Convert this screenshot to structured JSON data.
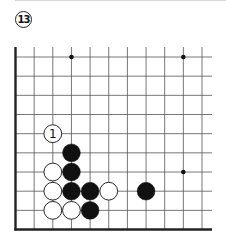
{
  "problem": {
    "number": "13"
  },
  "board": {
    "visible_columns": 11,
    "visible_rows": 10,
    "edges": [
      "left",
      "bottom"
    ],
    "colors": {
      "line": "#555555",
      "edge": "#222222",
      "black_stone": "#111111",
      "white_stone": "#ffffff"
    },
    "star_points": [
      {
        "col": 3,
        "row": 0
      },
      {
        "col": 9,
        "row": 0
      },
      {
        "col": 9,
        "row": 6
      }
    ],
    "stones": [
      {
        "color": "white",
        "col": 2,
        "row": 4,
        "label": "1"
      },
      {
        "color": "black",
        "col": 3,
        "row": 5
      },
      {
        "color": "white",
        "col": 2,
        "row": 6
      },
      {
        "color": "black",
        "col": 3,
        "row": 6
      },
      {
        "color": "white",
        "col": 2,
        "row": 7
      },
      {
        "color": "black",
        "col": 3,
        "row": 7
      },
      {
        "color": "black",
        "col": 4,
        "row": 7
      },
      {
        "color": "white",
        "col": 5,
        "row": 7
      },
      {
        "color": "black",
        "col": 7,
        "row": 7
      },
      {
        "color": "white",
        "col": 2,
        "row": 8
      },
      {
        "color": "white",
        "col": 3,
        "row": 8
      },
      {
        "color": "black",
        "col": 4,
        "row": 8
      }
    ]
  }
}
